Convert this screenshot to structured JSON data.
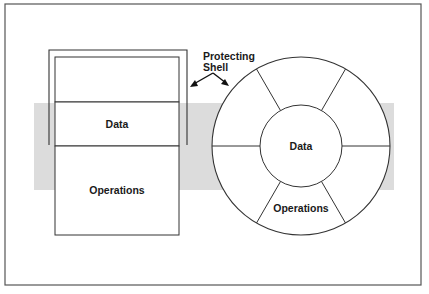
{
  "figure": {
    "frame_color": "#555555",
    "band_color": "#dcdcdc",
    "line_color": "#333333"
  },
  "left_diagram": {
    "segments": [
      {
        "label": ""
      },
      {
        "label": "Data"
      },
      {
        "label": "Operations"
      }
    ]
  },
  "annotation": {
    "line1": "Protecting",
    "line2": "Shell"
  },
  "right_diagram": {
    "center_label": "Data",
    "ring_label": "Operations"
  }
}
